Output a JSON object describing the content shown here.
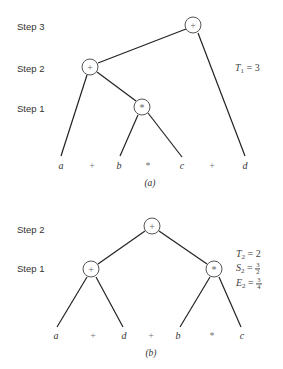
{
  "panel_a": {
    "caption": "(a)",
    "steps": [
      {
        "label": "Step 3",
        "y": 26
      },
      {
        "label": "Step 2",
        "y": 68
      },
      {
        "label": "Step 1",
        "y": 108
      }
    ],
    "nodes": [
      {
        "id": "root",
        "op": "+",
        "x": 193,
        "y": 25
      },
      {
        "id": "n2",
        "op": "+",
        "x": 90,
        "y": 67
      },
      {
        "id": "n1",
        "op": "*",
        "x": 142,
        "y": 107
      }
    ],
    "leaves": [
      {
        "text": "a",
        "kind": "var",
        "x": 61,
        "y": 165
      },
      {
        "text": "+",
        "kind": "op",
        "x": 92,
        "y": 165
      },
      {
        "text": "b",
        "kind": "var",
        "x": 119,
        "y": 165
      },
      {
        "text": "*",
        "kind": "op",
        "x": 148,
        "y": 165
      },
      {
        "text": "c",
        "kind": "var",
        "x": 182,
        "y": 165
      },
      {
        "text": "+",
        "kind": "op",
        "x": 212,
        "y": 165
      },
      {
        "text": "d",
        "kind": "var",
        "x": 245,
        "y": 165
      }
    ],
    "metrics": {
      "t_label": "T",
      "t_sub": "1",
      "t_value": "= 3"
    }
  },
  "panel_b": {
    "caption": "(b)",
    "steps": [
      {
        "label": "Step 2",
        "y": 229
      },
      {
        "label": "Step 1",
        "y": 268
      }
    ],
    "nodes": [
      {
        "id": "root",
        "op": "+",
        "x": 152,
        "y": 226
      },
      {
        "id": "left",
        "op": "+",
        "x": 91,
        "y": 269
      },
      {
        "id": "right",
        "op": "*",
        "x": 214,
        "y": 269
      }
    ],
    "leaves": [
      {
        "text": "a",
        "kind": "var",
        "x": 56,
        "y": 335
      },
      {
        "text": "+",
        "kind": "op",
        "x": 93,
        "y": 335
      },
      {
        "text": "d",
        "kind": "var",
        "x": 124,
        "y": 335
      },
      {
        "text": "+",
        "kind": "op",
        "x": 151,
        "y": 335
      },
      {
        "text": "b",
        "kind": "var",
        "x": 178,
        "y": 335
      },
      {
        "text": "*",
        "kind": "op",
        "x": 212,
        "y": 335
      },
      {
        "text": "c",
        "kind": "var",
        "x": 242,
        "y": 335
      }
    ],
    "metrics": {
      "t_label": "T",
      "t_sub": "2",
      "t_value": "= 2",
      "s_label": "S",
      "s_sub": "2",
      "s_eq": "=",
      "s_num": "3",
      "s_den": "2",
      "e_label": "E",
      "e_sub": "2",
      "e_eq": "=",
      "e_num": "3",
      "e_den": "4"
    }
  }
}
